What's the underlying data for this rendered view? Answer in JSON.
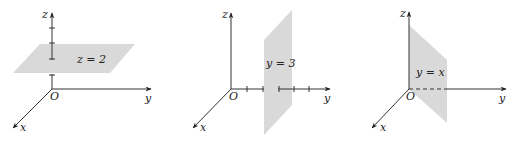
{
  "figure": {
    "panels": [
      {
        "name": "plane-z-equals-2",
        "axes": {
          "x": "x",
          "y": "y",
          "z": "z",
          "origin": "O"
        },
        "equation": "z = 2",
        "plane_color": "#d9d9d9"
      },
      {
        "name": "plane-y-equals-3",
        "axes": {
          "x": "x",
          "y": "y",
          "z": "z",
          "origin": "O"
        },
        "equation": "y = 3",
        "plane_color": "#d9d9d9"
      },
      {
        "name": "plane-y-equals-x",
        "axes": {
          "x": "x",
          "y": "y",
          "z": "z",
          "origin": "O"
        },
        "equation": "y = x",
        "plane_color": "#d9d9d9"
      }
    ]
  }
}
